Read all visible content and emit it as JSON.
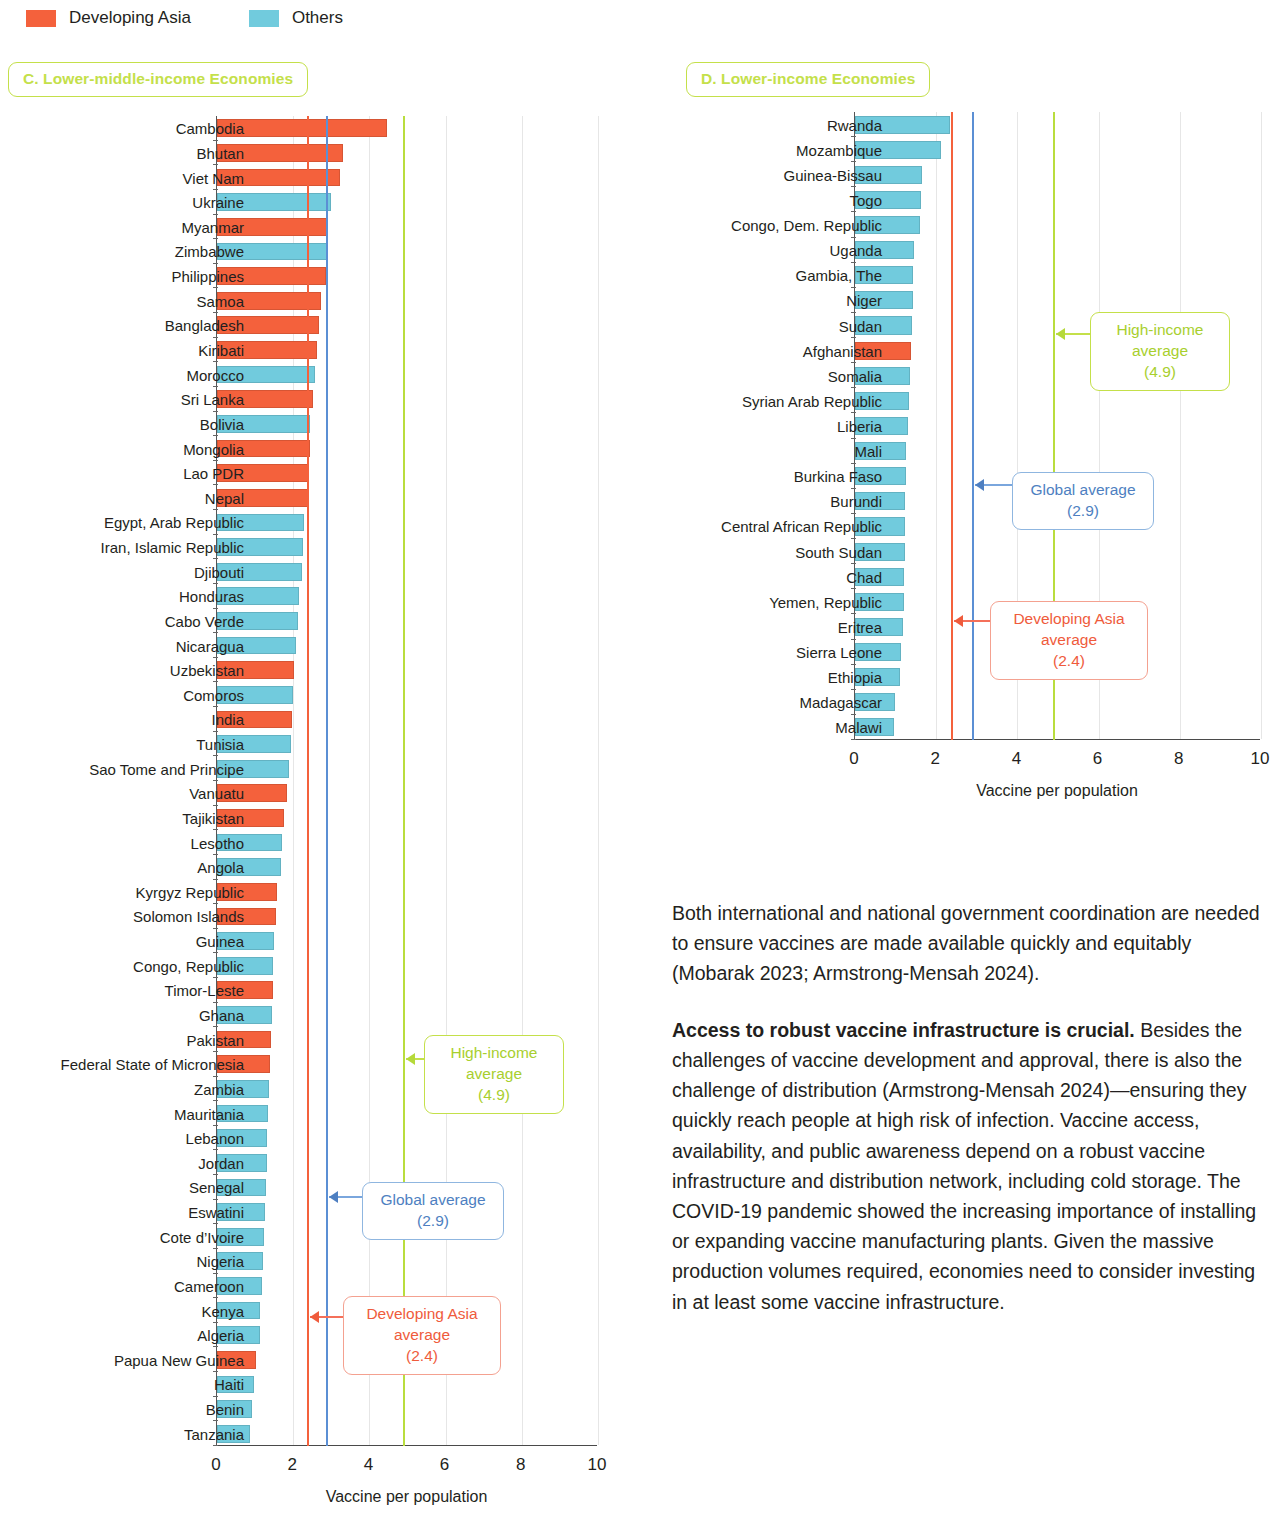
{
  "legend": {
    "items": [
      {
        "label": "Developing Asia",
        "color": "#f4613c",
        "key": "asia"
      },
      {
        "label": "Others",
        "color": "#71cbdd",
        "key": "other"
      }
    ]
  },
  "panel_c": {
    "title": "C. Lower-middle-income Economies"
  },
  "panel_d": {
    "title": "D. Lower-income Economies"
  },
  "axis": {
    "title": "Vaccine per population",
    "ticks": [
      "0",
      "2",
      "4",
      "6",
      "8",
      "10"
    ],
    "min": 0,
    "max": 10
  },
  "callouts": {
    "high_income": {
      "line1": "High-income",
      "line2": "average",
      "line3": "(4.9)",
      "value": 4.9,
      "color": "#c4e04a"
    },
    "global": {
      "line1": "Global average",
      "line2": "(2.9)",
      "value": 2.9,
      "color": "#5b8fd4"
    },
    "developing_asia": {
      "line1": "Developing Asia",
      "line2": "average",
      "line3": "(2.4)",
      "value": 2.4,
      "color": "#ef5b3c"
    }
  },
  "body": {
    "p1": "Both international and national government coordination are needed to ensure vaccines are made available quickly and equitably (Mobarak 2023; Armstrong-Mensah 2024).",
    "lead": "Access to robust vaccine infrastructure is crucial.",
    "p2": " Besides the challenges of vaccine development and approval, there is also the challenge of distribution (Armstrong-Mensah 2024)—ensuring they quickly reach people at high risk of infection. Vaccine access, availability, and public awareness depend on a robust vaccine infrastructure and distribution network, including cold storage. The COVID-19 pandemic showed the increasing importance of installing or expanding vaccine manufacturing plants. Given the massive production volumes required, economies need to consider investing in at least some vaccine infrastructure."
  },
  "chart_data": [
    {
      "type": "bar",
      "orientation": "horizontal",
      "title": "C. Lower-middle-income Economies",
      "xlabel": "Vaccine per population",
      "ylabel": "",
      "xlim": [
        0,
        10
      ],
      "xticks": [
        0,
        2,
        4,
        6,
        8,
        10
      ],
      "grid": true,
      "legend_position": "top-left",
      "reference_lines": [
        {
          "name": "Developing Asia average",
          "value": 2.4,
          "color": "#f4613c"
        },
        {
          "name": "Global average",
          "value": 2.9,
          "color": "#5b8fd4"
        },
        {
          "name": "High-income average",
          "value": 4.9,
          "color": "#b9dd3e"
        }
      ],
      "categories": [
        "Cambodia",
        "Bhutan",
        "Viet Nam",
        "Ukraine",
        "Myanmar",
        "Zimbabwe",
        "Philippines",
        "Samoa",
        "Bangladesh",
        "Kiribati",
        "Morocco",
        "Sri Lanka",
        "Bolivia",
        "Mongolia",
        "Lao PDR",
        "Nepal",
        "Egypt, Arab Republic",
        "Iran, Islamic Republic",
        "Djibouti",
        "Honduras",
        "Cabo Verde",
        "Nicaragua",
        "Uzbekistan",
        "Comoros",
        "India",
        "Tunisia",
        "Sao Tome and Principe",
        "Vanuatu",
        "Tajikistan",
        "Lesotho",
        "Angola",
        "Kyrgyz Republic",
        "Solomon Islands",
        "Guinea",
        "Congo, Republic",
        "Timor-Leste",
        "Ghana",
        "Pakistan",
        "Federal State of Micronesia",
        "Zambia",
        "Mauritania",
        "Lebanon",
        "Jordan",
        "Senegal",
        "Eswatini",
        "Cote d’Ivoire",
        "Nigeria",
        "Cameroon",
        "Kenya",
        "Algeria",
        "Papua New Guinea",
        "Haiti",
        "Benin",
        "Tanzania"
      ],
      "values": [
        4.45,
        3.3,
        3.22,
        3.0,
        2.92,
        2.88,
        2.85,
        2.72,
        2.68,
        2.62,
        2.58,
        2.52,
        2.45,
        2.44,
        2.42,
        2.38,
        2.28,
        2.26,
        2.22,
        2.15,
        2.12,
        2.08,
        2.02,
        2.0,
        1.98,
        1.95,
        1.9,
        1.85,
        1.75,
        1.7,
        1.68,
        1.58,
        1.55,
        1.5,
        1.48,
        1.46,
        1.44,
        1.42,
        1.4,
        1.36,
        1.34,
        1.32,
        1.3,
        1.28,
        1.26,
        1.24,
        1.22,
        1.18,
        1.14,
        1.12,
        1.02,
        0.98,
        0.92,
        0.86
      ],
      "groups": [
        "asia",
        "asia",
        "asia",
        "other",
        "asia",
        "other",
        "asia",
        "asia",
        "asia",
        "asia",
        "other",
        "asia",
        "other",
        "asia",
        "asia",
        "asia",
        "other",
        "other",
        "other",
        "other",
        "other",
        "other",
        "asia",
        "other",
        "asia",
        "other",
        "other",
        "asia",
        "asia",
        "other",
        "other",
        "asia",
        "asia",
        "other",
        "other",
        "asia",
        "other",
        "asia",
        "asia",
        "other",
        "other",
        "other",
        "other",
        "other",
        "other",
        "other",
        "other",
        "other",
        "other",
        "other",
        "asia",
        "other",
        "other",
        "other"
      ]
    },
    {
      "type": "bar",
      "orientation": "horizontal",
      "title": "D. Lower-income Economies",
      "xlabel": "Vaccine per population",
      "ylabel": "",
      "xlim": [
        0,
        10
      ],
      "xticks": [
        0,
        2,
        4,
        6,
        8,
        10
      ],
      "grid": true,
      "reference_lines": [
        {
          "name": "Developing Asia average",
          "value": 2.4,
          "color": "#f4613c"
        },
        {
          "name": "Global average",
          "value": 2.9,
          "color": "#5b8fd4"
        },
        {
          "name": "High-income average",
          "value": 4.9,
          "color": "#b9dd3e"
        }
      ],
      "categories": [
        "Rwanda",
        "Mozambique",
        "Guinea-Bissau",
        "Togo",
        "Congo, Dem. Republic",
        "Uganda",
        "Gambia, The",
        "Niger",
        "Sudan",
        "Afghanistan",
        "Somalia",
        "Syrian Arab Republic",
        "Liberia",
        "Mali",
        "Burkina Faso",
        "Burundi",
        "Central African Republic",
        "South Sudan",
        "Chad",
        "Yemen, Republic",
        "Eritrea",
        "Sierra Leone",
        "Ethiopia",
        "Madagascar",
        "Malawi"
      ],
      "values": [
        2.35,
        2.13,
        1.65,
        1.62,
        1.6,
        1.46,
        1.44,
        1.42,
        1.4,
        1.38,
        1.36,
        1.34,
        1.3,
        1.26,
        1.25,
        1.24,
        1.22,
        1.22,
        1.2,
        1.2,
        1.18,
        1.14,
        1.12,
        0.98,
        0.96
      ],
      "groups": [
        "other",
        "other",
        "other",
        "other",
        "other",
        "other",
        "other",
        "other",
        "other",
        "asia",
        "other",
        "other",
        "other",
        "other",
        "other",
        "other",
        "other",
        "other",
        "other",
        "other",
        "other",
        "other",
        "other",
        "other",
        "other"
      ]
    }
  ]
}
